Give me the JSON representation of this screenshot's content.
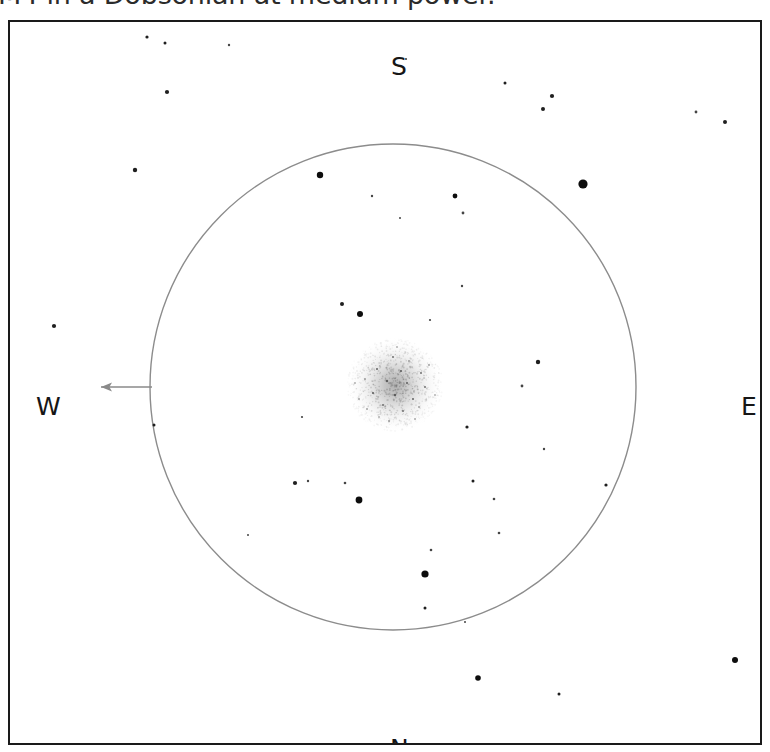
{
  "caption": {
    "text": "M4 in a Dobsonian at medium power."
  },
  "chart_data": {
    "type": "scatter",
    "xlabel": "",
    "ylabel": "",
    "xlim": [
      0,
      754
    ],
    "ylim": [
      0,
      725
    ],
    "grid": false,
    "legend": null,
    "field_of_view_circle": {
      "label": "eyepiece-field-of-view",
      "center_x": 383,
      "center_y": 365,
      "radius": 243,
      "stroke_color": "#8c8c8c",
      "stroke_width": 1.4
    },
    "deep_sky_object": {
      "label": "globular-cluster-glow",
      "center_x": 385,
      "center_y": 363,
      "radius": 48,
      "color": "#b3b3b3",
      "description": "diffuse round granular glow"
    },
    "drift_arrow": {
      "label": "drift-direction-arrow",
      "from_x": 142,
      "from_y": 365,
      "to_x": 80,
      "to_y": 365,
      "color": "#8a8a8a",
      "points_toward": "W"
    },
    "direction_labels": [
      {
        "name": "south",
        "text": "S",
        "x": 383,
        "y": 25
      },
      {
        "name": "north",
        "text": "N",
        "x": 382,
        "y": 708
      },
      {
        "name": "west",
        "text": "W",
        "x": 30,
        "y": 365
      },
      {
        "name": "east",
        "text": "E",
        "x": 733,
        "y": 365
      }
    ],
    "stars": [
      {
        "x": 137,
        "y": 15,
        "r": 1.6,
        "mag": 11.0
      },
      {
        "x": 155,
        "y": 21,
        "r": 1.5,
        "mag": 11.2
      },
      {
        "x": 219,
        "y": 23,
        "r": 1.2,
        "mag": 11.8
      },
      {
        "x": 396,
        "y": 37,
        "r": 1.1,
        "mag": 12.0
      },
      {
        "x": 495,
        "y": 61,
        "r": 1.5,
        "mag": 11.2
      },
      {
        "x": 542,
        "y": 74,
        "r": 2.1,
        "mag": 10.2
      },
      {
        "x": 533,
        "y": 87,
        "r": 2.0,
        "mag": 10.4
      },
      {
        "x": 157,
        "y": 70,
        "r": 2.1,
        "mag": 10.2
      },
      {
        "x": 686,
        "y": 90,
        "r": 1.4,
        "mag": 11.4
      },
      {
        "x": 715,
        "y": 100,
        "r": 2.0,
        "mag": 10.4
      },
      {
        "x": 125,
        "y": 148,
        "r": 2.2,
        "mag": 10.1
      },
      {
        "x": 310,
        "y": 153,
        "r": 3.2,
        "mag": 8.9
      },
      {
        "x": 573,
        "y": 162,
        "r": 4.6,
        "mag": 7.8
      },
      {
        "x": 445,
        "y": 174,
        "r": 2.4,
        "mag": 9.9
      },
      {
        "x": 453,
        "y": 191,
        "r": 1.4,
        "mag": 11.4
      },
      {
        "x": 362,
        "y": 174,
        "r": 1.2,
        "mag": 11.8
      },
      {
        "x": 390,
        "y": 196,
        "r": 1.0,
        "mag": 12.2
      },
      {
        "x": 452,
        "y": 264,
        "r": 1.2,
        "mag": 11.8
      },
      {
        "x": 332,
        "y": 282,
        "r": 2.0,
        "mag": 10.4
      },
      {
        "x": 350,
        "y": 292,
        "r": 3.0,
        "mag": 9.1
      },
      {
        "x": 44,
        "y": 304,
        "r": 2.1,
        "mag": 10.2
      },
      {
        "x": 420,
        "y": 298,
        "r": 1.1,
        "mag": 12.0
      },
      {
        "x": 528,
        "y": 340,
        "r": 2.2,
        "mag": 10.1
      },
      {
        "x": 512,
        "y": 364,
        "r": 1.4,
        "mag": 11.4
      },
      {
        "x": 144,
        "y": 403,
        "r": 1.5,
        "mag": 11.2
      },
      {
        "x": 292,
        "y": 395,
        "r": 1.1,
        "mag": 12.0
      },
      {
        "x": 457,
        "y": 405,
        "r": 1.6,
        "mag": 11.0
      },
      {
        "x": 534,
        "y": 427,
        "r": 1.2,
        "mag": 11.8
      },
      {
        "x": 285,
        "y": 461,
        "r": 2.1,
        "mag": 10.2
      },
      {
        "x": 298,
        "y": 459,
        "r": 1.2,
        "mag": 11.8
      },
      {
        "x": 335,
        "y": 461,
        "r": 1.3,
        "mag": 11.6
      },
      {
        "x": 463,
        "y": 459,
        "r": 1.5,
        "mag": 11.2
      },
      {
        "x": 596,
        "y": 463,
        "r": 1.6,
        "mag": 11.0
      },
      {
        "x": 349,
        "y": 478,
        "r": 3.4,
        "mag": 8.7
      },
      {
        "x": 484,
        "y": 477,
        "r": 1.3,
        "mag": 11.6
      },
      {
        "x": 489,
        "y": 511,
        "r": 1.3,
        "mag": 11.6
      },
      {
        "x": 421,
        "y": 528,
        "r": 1.3,
        "mag": 11.6
      },
      {
        "x": 415,
        "y": 552,
        "r": 3.6,
        "mag": 8.5
      },
      {
        "x": 415,
        "y": 586,
        "r": 1.5,
        "mag": 11.2
      },
      {
        "x": 468,
        "y": 656,
        "r": 2.8,
        "mag": 9.3
      },
      {
        "x": 549,
        "y": 672,
        "r": 1.5,
        "mag": 11.2
      },
      {
        "x": 725,
        "y": 638,
        "r": 3.0,
        "mag": 9.1
      },
      {
        "x": 455,
        "y": 600,
        "r": 1.0,
        "mag": 12.2
      },
      {
        "x": 238,
        "y": 513,
        "r": 1.0,
        "mag": 12.2
      }
    ],
    "cluster_speckles": [
      {
        "dx": -2,
        "dy": -28,
        "r": 0.9
      },
      {
        "dx": 14,
        "dy": -24,
        "r": 0.8
      },
      {
        "dx": -18,
        "dy": -16,
        "r": 1.0
      },
      {
        "dx": 6,
        "dy": -14,
        "r": 1.1
      },
      {
        "dx": 26,
        "dy": -12,
        "r": 0.9
      },
      {
        "dx": -30,
        "dy": -6,
        "r": 0.8
      },
      {
        "dx": -8,
        "dy": -4,
        "r": 1.2
      },
      {
        "dx": 12,
        "dy": -2,
        "r": 1.0
      },
      {
        "dx": 30,
        "dy": 2,
        "r": 0.9
      },
      {
        "dx": -22,
        "dy": 8,
        "r": 1.1
      },
      {
        "dx": 0,
        "dy": 10,
        "r": 1.2
      },
      {
        "dx": 18,
        "dy": 14,
        "r": 1.0
      },
      {
        "dx": -12,
        "dy": 20,
        "r": 0.9
      },
      {
        "dx": 8,
        "dy": 26,
        "r": 0.9
      },
      {
        "dx": -28,
        "dy": 24,
        "r": 0.8
      },
      {
        "dx": 24,
        "dy": 22,
        "r": 0.8
      },
      {
        "dx": -6,
        "dy": 36,
        "r": 0.8
      },
      {
        "dx": 34,
        "dy": -20,
        "r": 0.8
      },
      {
        "dx": -36,
        "dy": 14,
        "r": 0.8
      },
      {
        "dx": 2,
        "dy": -38,
        "r": 0.7
      },
      {
        "dx": 20,
        "dy": 34,
        "r": 0.7
      },
      {
        "dx": -16,
        "dy": 32,
        "r": 0.7
      },
      {
        "dx": 40,
        "dy": 10,
        "r": 0.7
      },
      {
        "dx": -40,
        "dy": -2,
        "r": 0.7
      }
    ]
  }
}
